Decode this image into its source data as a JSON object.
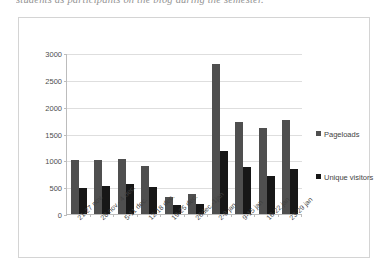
{
  "document": {
    "clipped_text_line": "students as participants on the blog during the semester."
  },
  "chart_data": {
    "type": "bar",
    "title": "",
    "xlabel": "",
    "ylabel": "",
    "ylim": [
      0,
      3000
    ],
    "yticks": [
      0,
      500,
      1000,
      1500,
      2000,
      2500,
      3000
    ],
    "grid": true,
    "legend_position": "right",
    "categories": [
      "21-27 nov.",
      "28 nov.- 4 dec.",
      "5-11 dec.",
      "12-18 dec.",
      "19-25 dec.",
      "26dec.-1jan",
      "2-8 jan",
      "9-15 jan",
      "16-22 jan",
      "23-29 jan"
    ],
    "series": [
      {
        "name": "Pageloads",
        "color": "#4f4f4f",
        "values": [
          1010,
          1000,
          1020,
          900,
          320,
          380,
          2790,
          1720,
          1600,
          1760
        ]
      },
      {
        "name": "Unique visitors",
        "color": "#171717",
        "values": [
          490,
          520,
          560,
          500,
          160,
          190,
          1180,
          880,
          700,
          840
        ]
      }
    ]
  }
}
